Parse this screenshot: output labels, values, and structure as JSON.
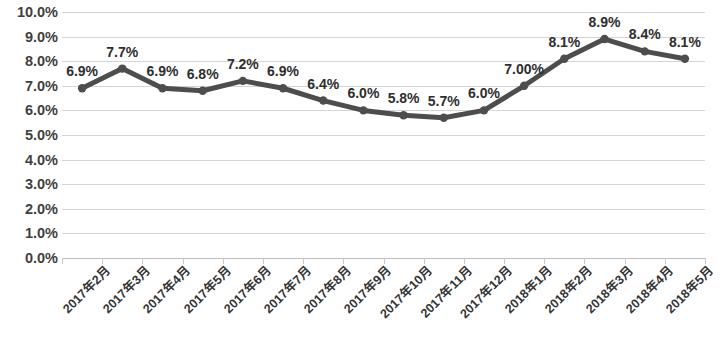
{
  "chart_data": {
    "type": "line",
    "title": "",
    "xlabel": "",
    "ylabel": "",
    "ylim": [
      0,
      10
    ],
    "grid": true,
    "legend": false,
    "categories": [
      "2017年2月",
      "2017年3月",
      "2017年4月",
      "2017年5月",
      "2017年6月",
      "2017年7月",
      "2017年8月",
      "2017年9月",
      "2017年10月",
      "2017年11月",
      "2017年12月",
      "2018年1月",
      "2018年2月",
      "2018年3月",
      "2018年4月",
      "2018年5月"
    ],
    "values": [
      6.9,
      7.7,
      6.9,
      6.8,
      7.2,
      6.9,
      6.4,
      6.0,
      5.8,
      5.7,
      6.0,
      7.0,
      8.1,
      8.9,
      8.4,
      8.1
    ],
    "point_labels": [
      "6.9%",
      "7.7%",
      "6.9%",
      "6.8%",
      "7.2%",
      "6.9%",
      "6.4%",
      "6.0%",
      "5.8%",
      "5.7%",
      "6.0%",
      "7.00%",
      "8.1%",
      "8.9%",
      "8.4%",
      "8.1%"
    ],
    "y_ticks": [
      "0.0%",
      "1.0%",
      "2.0%",
      "3.0%",
      "4.0%",
      "5.0%",
      "6.0%",
      "7.0%",
      "8.0%",
      "9.0%",
      "10.0%"
    ],
    "y_tick_values": [
      0,
      1,
      2,
      3,
      4,
      5,
      6,
      7,
      8,
      9,
      10
    ],
    "series_color": "#4d4d4d",
    "gridline_color": "#d4d4d4",
    "marker_color": "#4d4d4d",
    "background_color": "#ffffff"
  }
}
